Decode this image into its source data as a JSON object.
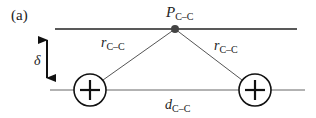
{
  "figure": {
    "panel_label": "(a)",
    "point_label": {
      "main": "P",
      "sub": "C–C"
    },
    "left_distance_label": {
      "main": "r",
      "sub": "C–C"
    },
    "right_distance_label": {
      "main": "r",
      "sub": "C–C"
    },
    "separation_label": {
      "main": "d",
      "sub": "C–C"
    },
    "height_label": "δ",
    "left_charge_symbol": "+",
    "right_charge_symbol": "+",
    "colors": {
      "line": "#222222",
      "point": "#444444",
      "thin_line": "#666666"
    }
  }
}
